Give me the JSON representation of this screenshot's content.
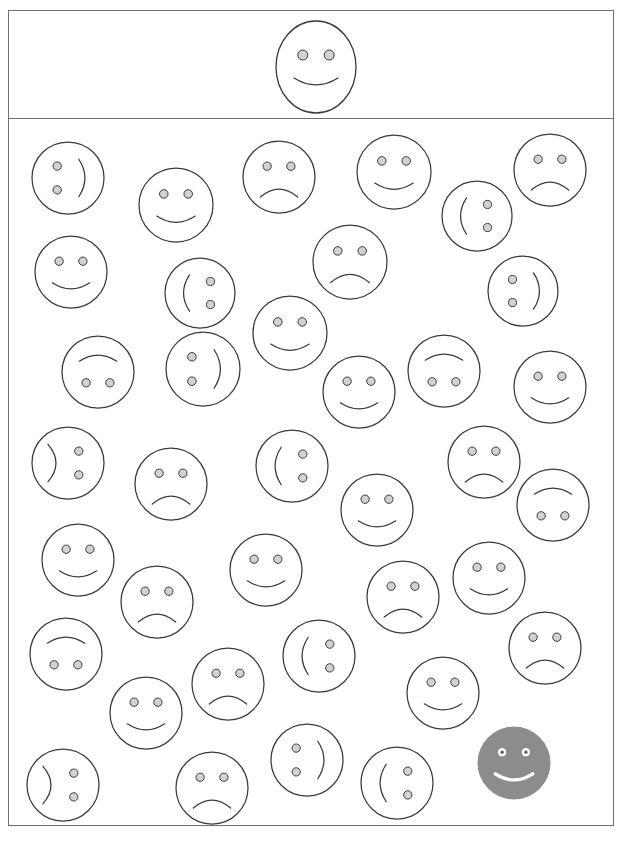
{
  "task": {
    "title": "Smiley Face Visual Search",
    "instruction_icon": "smiley-target-icon",
    "frame": {
      "x": 8,
      "y": 10,
      "width": 606,
      "height": 816
    },
    "divider_y": 119
  },
  "colors": {
    "stroke": "#3a3a3a",
    "frame": "#6f6f6f",
    "eye_fill": "#d2d2d2",
    "background": "#ffffff",
    "selected_fill": "#8c8c8c",
    "selected_stroke": "#8c8c8c",
    "selected_feature": "#ffffff",
    "selected_pupil": "#555555"
  },
  "target": {
    "label": "target-face",
    "orientation": "upright",
    "expression": "happy",
    "cx": 316,
    "cy": 67,
    "rx": 40,
    "ry": 46,
    "shape": "ellipse"
  },
  "legend": {
    "orientations": [
      "upright",
      "upside-down",
      "rotated-cw-90",
      "rotated-ccw-90"
    ],
    "expressions": [
      "happy",
      "sad"
    ]
  },
  "stats": {
    "total_faces": 40,
    "selected_count": 1
  },
  "faces": [
    {
      "id": 1,
      "cx": 68,
      "cy": 178,
      "r": 36,
      "orientation": "rotated-ccw-90",
      "expression": "happy",
      "selected": false
    },
    {
      "id": 2,
      "cx": 176,
      "cy": 205,
      "r": 37,
      "orientation": "upright",
      "expression": "happy",
      "selected": false
    },
    {
      "id": 3,
      "cx": 279,
      "cy": 177,
      "r": 36,
      "orientation": "upright",
      "expression": "sad",
      "selected": false
    },
    {
      "id": 4,
      "cx": 394,
      "cy": 172,
      "r": 37,
      "orientation": "upright",
      "expression": "happy",
      "selected": false
    },
    {
      "id": 5,
      "cx": 477,
      "cy": 216,
      "r": 35,
      "orientation": "rotated-cw-90",
      "expression": "happy",
      "selected": false
    },
    {
      "id": 6,
      "cx": 550,
      "cy": 170,
      "r": 36,
      "orientation": "upright",
      "expression": "sad",
      "selected": false
    },
    {
      "id": 7,
      "cx": 71,
      "cy": 272,
      "r": 36,
      "orientation": "upright",
      "expression": "happy",
      "selected": false
    },
    {
      "id": 8,
      "cx": 200,
      "cy": 293,
      "r": 35,
      "orientation": "rotated-cw-90",
      "expression": "happy",
      "selected": false
    },
    {
      "id": 9,
      "cx": 350,
      "cy": 262,
      "r": 37,
      "orientation": "upright",
      "expression": "sad",
      "selected": false
    },
    {
      "id": 10,
      "cx": 523,
      "cy": 291,
      "r": 35,
      "orientation": "rotated-ccw-90",
      "expression": "happy",
      "selected": false
    },
    {
      "id": 11,
      "cx": 98,
      "cy": 372,
      "r": 36,
      "orientation": "upside-down",
      "expression": "happy",
      "selected": false
    },
    {
      "id": 12,
      "cx": 203,
      "cy": 369,
      "r": 37,
      "orientation": "rotated-ccw-90",
      "expression": "happy",
      "selected": false
    },
    {
      "id": 13,
      "cx": 290,
      "cy": 333,
      "r": 37,
      "orientation": "upright",
      "expression": "happy",
      "selected": false
    },
    {
      "id": 14,
      "cx": 359,
      "cy": 392,
      "r": 36,
      "orientation": "upright",
      "expression": "happy",
      "selected": false
    },
    {
      "id": 15,
      "cx": 444,
      "cy": 371,
      "r": 36,
      "orientation": "upside-down",
      "expression": "happy",
      "selected": false
    },
    {
      "id": 16,
      "cx": 550,
      "cy": 387,
      "r": 36,
      "orientation": "upright",
      "expression": "happy",
      "selected": false
    },
    {
      "id": 17,
      "cx": 68,
      "cy": 463,
      "r": 36,
      "orientation": "rotated-cw-90",
      "expression": "sad",
      "selected": false
    },
    {
      "id": 18,
      "cx": 171,
      "cy": 484,
      "r": 36,
      "orientation": "upright",
      "expression": "sad",
      "selected": false
    },
    {
      "id": 19,
      "cx": 292,
      "cy": 466,
      "r": 36,
      "orientation": "rotated-cw-90",
      "expression": "happy",
      "selected": false
    },
    {
      "id": 20,
      "cx": 377,
      "cy": 510,
      "r": 36,
      "orientation": "upright",
      "expression": "happy",
      "selected": false
    },
    {
      "id": 21,
      "cx": 484,
      "cy": 462,
      "r": 36,
      "orientation": "upright",
      "expression": "sad",
      "selected": false
    },
    {
      "id": 22,
      "cx": 553,
      "cy": 505,
      "r": 36,
      "orientation": "upside-down",
      "expression": "happy",
      "selected": false
    },
    {
      "id": 23,
      "cx": 78,
      "cy": 560,
      "r": 36,
      "orientation": "upright",
      "expression": "happy",
      "selected": false
    },
    {
      "id": 24,
      "cx": 157,
      "cy": 602,
      "r": 36,
      "orientation": "upright",
      "expression": "sad",
      "selected": false
    },
    {
      "id": 25,
      "cx": 266,
      "cy": 570,
      "r": 36,
      "orientation": "upright",
      "expression": "happy",
      "selected": false
    },
    {
      "id": 26,
      "cx": 403,
      "cy": 597,
      "r": 36,
      "orientation": "upright",
      "expression": "sad",
      "selected": false
    },
    {
      "id": 27,
      "cx": 489,
      "cy": 578,
      "r": 36,
      "orientation": "upright",
      "expression": "happy",
      "selected": false
    },
    {
      "id": 28,
      "cx": 66,
      "cy": 654,
      "r": 36,
      "orientation": "upside-down",
      "expression": "happy",
      "selected": false
    },
    {
      "id": 29,
      "cx": 146,
      "cy": 713,
      "r": 36,
      "orientation": "upright",
      "expression": "happy",
      "selected": false
    },
    {
      "id": 30,
      "cx": 228,
      "cy": 684,
      "r": 36,
      "orientation": "upright",
      "expression": "sad",
      "selected": false
    },
    {
      "id": 31,
      "cx": 319,
      "cy": 656,
      "r": 36,
      "orientation": "rotated-cw-90",
      "expression": "happy",
      "selected": false
    },
    {
      "id": 32,
      "cx": 443,
      "cy": 693,
      "r": 36,
      "orientation": "upright",
      "expression": "happy",
      "selected": false
    },
    {
      "id": 33,
      "cx": 545,
      "cy": 648,
      "r": 36,
      "orientation": "upright",
      "expression": "sad",
      "selected": false
    },
    {
      "id": 34,
      "cx": 63,
      "cy": 785,
      "r": 36,
      "orientation": "rotated-cw-90",
      "expression": "sad",
      "selected": false
    },
    {
      "id": 35,
      "cx": 212,
      "cy": 788,
      "r": 36,
      "orientation": "upright",
      "expression": "sad",
      "selected": false
    },
    {
      "id": 36,
      "cx": 307,
      "cy": 760,
      "r": 36,
      "orientation": "rotated-ccw-90",
      "expression": "happy",
      "selected": false
    },
    {
      "id": 37,
      "cx": 397,
      "cy": 783,
      "r": 36,
      "orientation": "rotated-cw-90",
      "expression": "happy",
      "selected": false
    },
    {
      "id": 38,
      "cx": 514,
      "cy": 763,
      "r": 36,
      "orientation": "upright",
      "expression": "happy",
      "selected": true
    },
    {
      "id": 39,
      "cx": 341,
      "cy": 233,
      "r": 0,
      "orientation": "upright",
      "expression": "sad",
      "selected": false,
      "hidden": true
    },
    {
      "id": 40,
      "cx": 454,
      "cy": 627,
      "r": 0,
      "orientation": "upright",
      "expression": "sad",
      "selected": false,
      "hidden": true
    }
  ]
}
